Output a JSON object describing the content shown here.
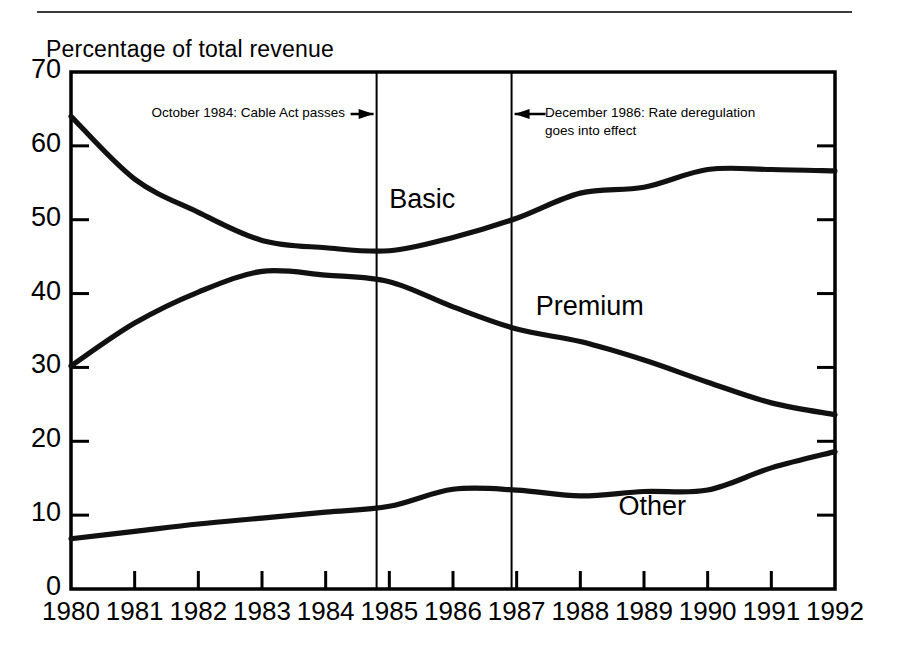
{
  "figure": {
    "axis_title": "Percentage of total revenue"
  },
  "annotations": {
    "left": {
      "text": "October 1984: Cable Act passes",
      "arrow": "right-arrow-icon",
      "year": 1984.8
    },
    "right": {
      "text": "December 1986: Rate deregulation\ngoes into effect",
      "arrow": "left-arrow-icon",
      "year": 1986.92
    }
  },
  "chart_data": {
    "type": "line",
    "title": "",
    "subtitle": "",
    "xlabel": "",
    "ylabel": "Percentage of total revenue",
    "xlim": [
      1980,
      1992
    ],
    "ylim": [
      0,
      70
    ],
    "grid": false,
    "legend_position": "inline-labels",
    "x": [
      1980,
      1981,
      1982,
      1983,
      1984,
      1985,
      1986,
      1987,
      1988,
      1989,
      1990,
      1991,
      1992
    ],
    "yticks": [
      0,
      10,
      20,
      30,
      40,
      50,
      60,
      70
    ],
    "xticks": [
      1980,
      1981,
      1982,
      1983,
      1984,
      1985,
      1986,
      1987,
      1988,
      1989,
      1990,
      1991,
      1992
    ],
    "series": [
      {
        "name": "Basic",
        "values": [
          64.0,
          55.5,
          51.0,
          47.2,
          46.2,
          45.8,
          47.6,
          50.2,
          53.6,
          54.4,
          56.8,
          56.8,
          56.6
        ],
        "label_x": 1985.0,
        "label_y": 52.5
      },
      {
        "name": "Premium",
        "values": [
          30.2,
          36.0,
          40.2,
          43.0,
          42.5,
          41.6,
          38.2,
          35.2,
          33.5,
          31.0,
          28.0,
          25.2,
          23.6
        ],
        "label_x": 1987.3,
        "label_y": 38.0
      },
      {
        "name": "Other",
        "values": [
          6.8,
          7.8,
          8.8,
          9.6,
          10.4,
          11.2,
          13.5,
          13.4,
          12.6,
          13.2,
          13.4,
          16.4,
          18.6
        ],
        "label_x": 1988.6,
        "label_y": 11.0
      }
    ]
  }
}
